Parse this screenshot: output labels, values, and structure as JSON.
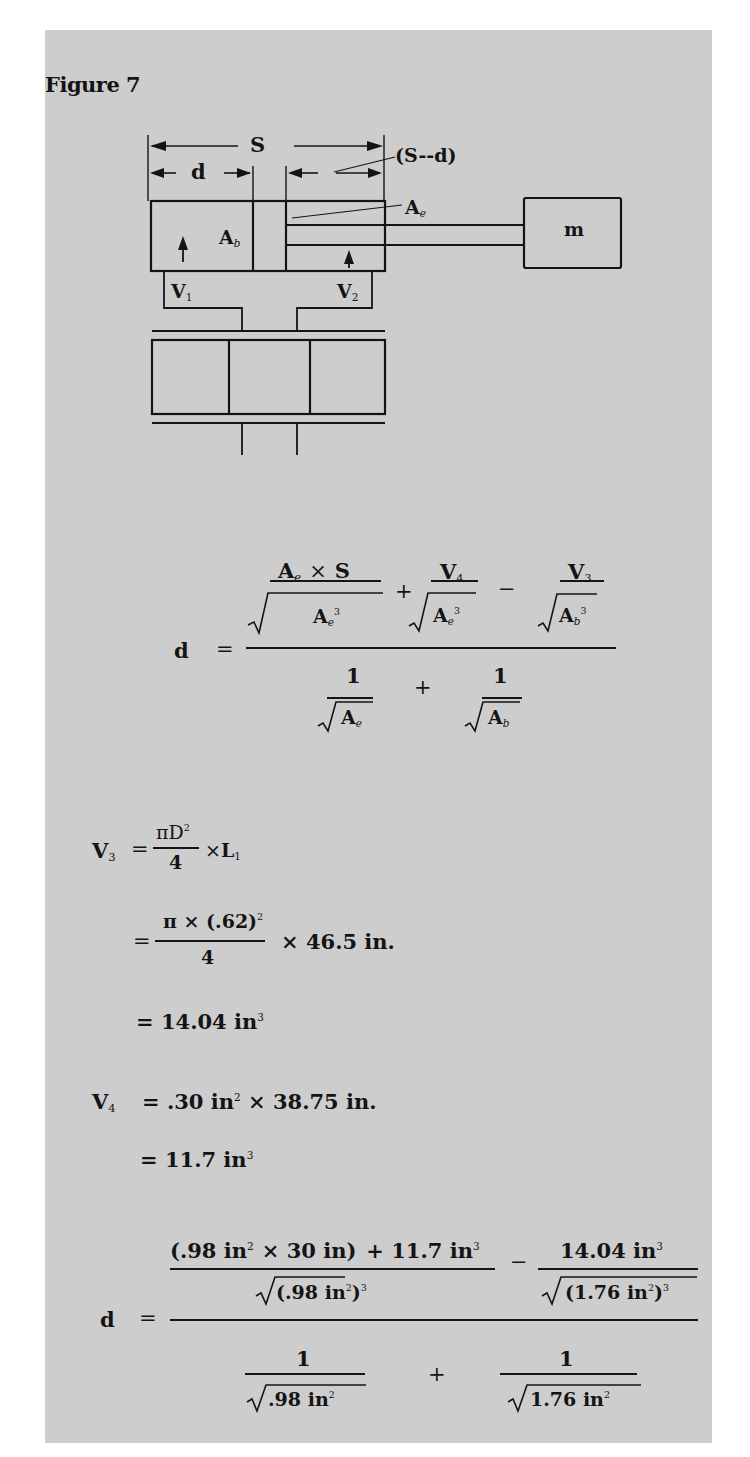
{
  "figure": {
    "title": "Figure 7",
    "panel_color": "#cdcdcd",
    "ink_color": "#141414"
  },
  "diagram": {
    "labels": {
      "stroke": "S",
      "displacement": "d",
      "remaining": "(S--d)",
      "area_rod_end": {
        "base": "A",
        "sub": "e"
      },
      "area_bore": {
        "base": "A",
        "sub": "b"
      },
      "volume_1": {
        "base": "V",
        "sub": "1"
      },
      "volume_2": {
        "base": "V",
        "sub": "2"
      },
      "mass": "m"
    }
  },
  "formula_general": {
    "lhs": "d",
    "eq": "=",
    "term1_num": {
      "a": "A",
      "a_sub": "e",
      "times": "×",
      "s": "S"
    },
    "term1_den": {
      "a": "A",
      "a_sub": "e",
      "exp": "3"
    },
    "plus": "+",
    "term2_num": {
      "v": "V",
      "v_sub": "4"
    },
    "term2_den": {
      "a": "A",
      "a_sub": "e",
      "exp": "3"
    },
    "minus": "−",
    "term3_num": {
      "v": "V",
      "v_sub": "3"
    },
    "term3_den": {
      "a": "A",
      "a_sub": "b",
      "exp": "3"
    },
    "den1_num": "1",
    "den1_den": {
      "a": "A",
      "a_sub": "e"
    },
    "den_plus": "+",
    "den2_num": "1",
    "den2_den": {
      "a": "A",
      "a_sub": "b"
    }
  },
  "v3_calc": {
    "lhs": "V",
    "lhs_sub": "3",
    "eq": "=",
    "frac_num": "πD",
    "frac_num_exp": "2",
    "frac_den": "4",
    "times": "×",
    "l": "L",
    "l_sub": "1",
    "line2_eq": "=",
    "line2_num_pre": "π × (.62)",
    "line2_num_exp": "2",
    "line2_den": "4",
    "line2_times": "× 46.5 in.",
    "line3": "= 14.04 in",
    "line3_exp": "3"
  },
  "v4_calc": {
    "lhs": "V",
    "lhs_sub": "4",
    "rhs_a": "= .30 in",
    "rhs_a_exp": "2",
    "rhs_b": "× 38.75 in.",
    "line2": "= 11.7 in",
    "line2_exp": "3"
  },
  "formula_numeric": {
    "lhs": "d",
    "eq": "=",
    "num1_a": "(.98 in",
    "num1_a_exp": "2",
    "num1_b": "×  30 in)",
    "num1_c": "+ 11.7 in",
    "num1_c_exp": "3",
    "den1": "(.98 in",
    "den1_exp_inner": "2",
    "den1_close": ")",
    "den1_exp": "3",
    "minus": "−",
    "num2": "14.04 in",
    "num2_exp": "3",
    "den2": "(1.76 in",
    "den2_exp_inner": "2",
    "den2_close": ")",
    "den2_exp": "3",
    "bottom1_num": "1",
    "bottom1_den": ".98 in",
    "bottom1_den_exp": "2",
    "bottom_plus": "+",
    "bottom2_num": "1",
    "bottom2_den": "1.76 in",
    "bottom2_den_exp": "2"
  }
}
